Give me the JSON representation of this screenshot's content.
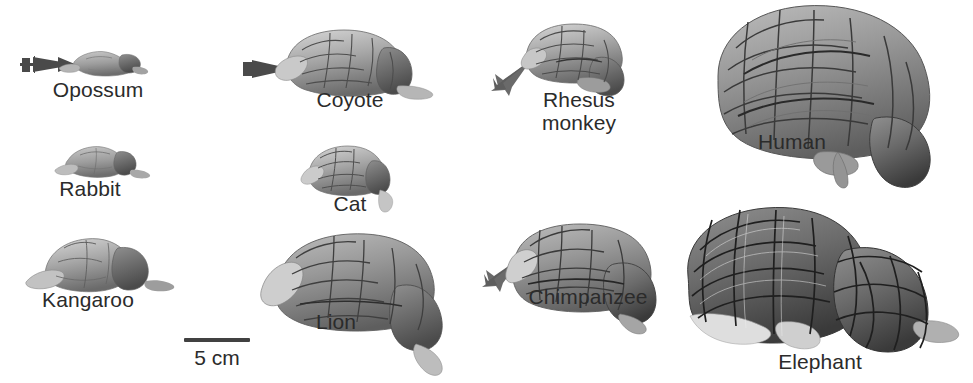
{
  "figure": {
    "background_color": "#ffffff",
    "text_color": "#2b2b2b",
    "arrow_color": "#4a4a4a",
    "scale_bar": {
      "label": "5 cm",
      "length_px": 66,
      "name": "scale-bar"
    }
  },
  "specimens": [
    {
      "id": "opossum",
      "label": "Opossum",
      "column": 1,
      "row": 1,
      "has_arrow": true,
      "arrow_direction": "right",
      "relative_size": "very small"
    },
    {
      "id": "rabbit",
      "label": "Rabbit",
      "column": 1,
      "row": 2,
      "has_arrow": false,
      "arrow_direction": "",
      "relative_size": "very small"
    },
    {
      "id": "kangaroo",
      "label": "Kangaroo",
      "column": 1,
      "row": 3,
      "has_arrow": false,
      "arrow_direction": "",
      "relative_size": "small"
    },
    {
      "id": "coyote",
      "label": "Coyote",
      "column": 2,
      "row": 1,
      "has_arrow": true,
      "arrow_direction": "right",
      "relative_size": "small"
    },
    {
      "id": "cat",
      "label": "Cat",
      "column": 2,
      "row": 2,
      "has_arrow": false,
      "arrow_direction": "",
      "relative_size": "small"
    },
    {
      "id": "lion",
      "label": "Lion",
      "column": 2,
      "row": 3,
      "has_arrow": false,
      "arrow_direction": "",
      "relative_size": "medium"
    },
    {
      "id": "rhesus-monkey",
      "label": "Rhesus\nmonkey",
      "column": 3,
      "row": 1,
      "has_arrow": true,
      "arrow_direction": "up-right",
      "relative_size": "small"
    },
    {
      "id": "chimpanzee",
      "label": "Chimpanzee",
      "column": 3,
      "row": 3,
      "has_arrow": true,
      "arrow_direction": "up-right",
      "relative_size": "medium"
    },
    {
      "id": "human",
      "label": "Human",
      "column": 4,
      "row": 1,
      "has_arrow": false,
      "arrow_direction": "",
      "relative_size": "large"
    },
    {
      "id": "elephant",
      "label": "Elephant",
      "column": 4,
      "row": 3,
      "has_arrow": false,
      "arrow_direction": "",
      "relative_size": "very large"
    }
  ]
}
